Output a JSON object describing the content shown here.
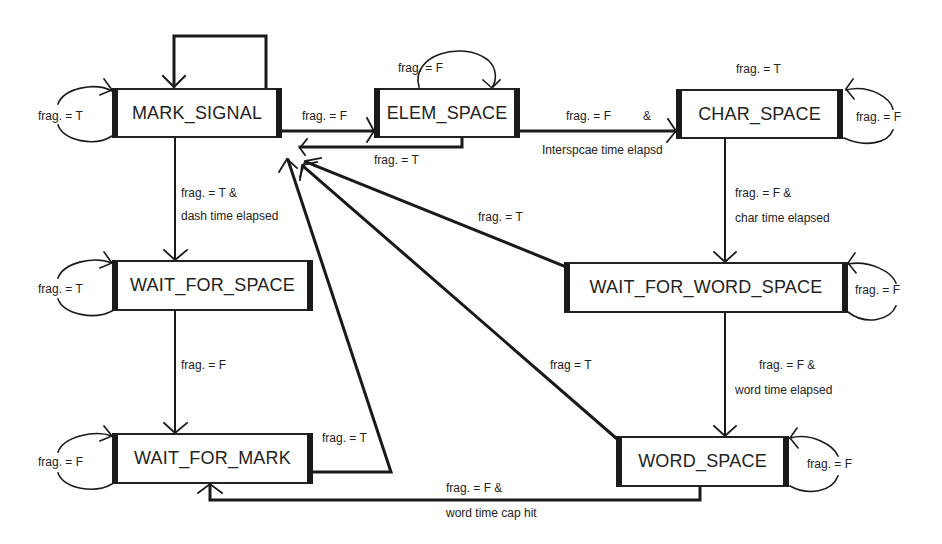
{
  "diagram": {
    "type": "state-machine",
    "states": {
      "mark_signal": "MARK_SIGNAL",
      "elem_space": "ELEM_SPACE",
      "char_space": "CHAR_SPACE",
      "wait_for_space": "WAIT_FOR_SPACE",
      "wait_for_word_space": "WAIT_FOR_WORD_SPACE",
      "wait_for_mark": "WAIT_FOR_MARK",
      "word_space": "WORD_SPACE"
    },
    "labels": {
      "mark_signal_self": "frag. = T",
      "mark_to_elem": "frag. = F",
      "elem_self": "frag. = F",
      "elem_to_mark": "frag. = T",
      "elem_to_char_1": "frag. = F",
      "elem_to_char_amp": "&",
      "elem_to_char_2": "Interspcae time elapsd",
      "char_to_mark": "frag. = T",
      "char_self": "frag. = F",
      "mark_to_wfs_1": "frag. = T &",
      "mark_to_wfs_2": "dash time elapsed",
      "char_to_wfws_1": "frag. = F &",
      "char_to_wfws_2": "char time elapsed",
      "wfws_to_mark": "frag. = T",
      "wfs_self": "frag. = T",
      "wfws_self": "frag. = F",
      "wfs_to_wfm": "frag. = F",
      "wfws_to_ws_1": "frag. = F &",
      "wfws_to_ws_2": "word time elapsed",
      "ws_to_mark": "frag = T",
      "wfm_self": "frag. = F",
      "wfm_to_mark": "frag. = T",
      "ws_self": "frag. = F",
      "ws_to_wfm_1": "frag. = F &",
      "ws_to_wfm_2": "word time cap hit"
    },
    "transitions": [
      {
        "from": "MARK_SIGNAL",
        "to": "MARK_SIGNAL",
        "label": "frag. = T"
      },
      {
        "from": "MARK_SIGNAL",
        "to": "ELEM_SPACE",
        "label": "frag. = F"
      },
      {
        "from": "MARK_SIGNAL",
        "to": "WAIT_FOR_SPACE",
        "label": "frag. = T & dash time elapsed"
      },
      {
        "from": "ELEM_SPACE",
        "to": "ELEM_SPACE",
        "label": "frag. = F"
      },
      {
        "from": "ELEM_SPACE",
        "to": "MARK_SIGNAL",
        "label": "frag. = T"
      },
      {
        "from": "ELEM_SPACE",
        "to": "CHAR_SPACE",
        "label": "frag. = F & Interspcae time elapsd"
      },
      {
        "from": "CHAR_SPACE",
        "to": "CHAR_SPACE",
        "label": "frag. = F"
      },
      {
        "from": "CHAR_SPACE",
        "to": "MARK_SIGNAL",
        "label": "frag. = T"
      },
      {
        "from": "CHAR_SPACE",
        "to": "WAIT_FOR_WORD_SPACE",
        "label": "frag. = F & char time elapsed"
      },
      {
        "from": "WAIT_FOR_SPACE",
        "to": "WAIT_FOR_SPACE",
        "label": "frag. = T"
      },
      {
        "from": "WAIT_FOR_SPACE",
        "to": "WAIT_FOR_MARK",
        "label": "frag. = F"
      },
      {
        "from": "WAIT_FOR_WORD_SPACE",
        "to": "WAIT_FOR_WORD_SPACE",
        "label": "frag. = F"
      },
      {
        "from": "WAIT_FOR_WORD_SPACE",
        "to": "MARK_SIGNAL",
        "label": "frag. = T"
      },
      {
        "from": "WAIT_FOR_WORD_SPACE",
        "to": "WORD_SPACE",
        "label": "frag. = F & word time elapsed"
      },
      {
        "from": "WAIT_FOR_MARK",
        "to": "WAIT_FOR_MARK",
        "label": "frag. = F"
      },
      {
        "from": "WAIT_FOR_MARK",
        "to": "MARK_SIGNAL",
        "label": "frag. = T"
      },
      {
        "from": "WORD_SPACE",
        "to": "WORD_SPACE",
        "label": "frag. = F"
      },
      {
        "from": "WORD_SPACE",
        "to": "MARK_SIGNAL",
        "label": "frag = T"
      },
      {
        "from": "WORD_SPACE",
        "to": "WAIT_FOR_MARK",
        "label": "frag. = F & word time cap hit"
      }
    ]
  }
}
